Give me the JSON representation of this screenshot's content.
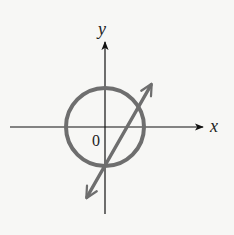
{
  "diagram": {
    "type": "coordinate-plane",
    "labels": {
      "x_axis": "x",
      "y_axis": "y",
      "origin": "0"
    },
    "colors": {
      "background": "#f7f7f5",
      "axes": "#111111",
      "curves": "#6e6e6e",
      "text": "#222222"
    },
    "shapes": [
      {
        "kind": "circle",
        "description": "circle centered at origin intersecting both axes"
      },
      {
        "kind": "line",
        "description": "line with arrows at both ends, positive slope, crossing the circle twice; intercepts positive x-axis and negative y-axis"
      }
    ]
  }
}
